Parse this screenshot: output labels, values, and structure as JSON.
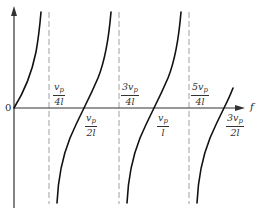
{
  "diagram": {
    "type": "tangent-like periodic function plot (reactance vs frequency)",
    "origin_label": "0",
    "x_axis_label": "f",
    "colors": {
      "curve": "#111111",
      "axis": "#333333",
      "asymptote": "#999999",
      "text": "#333333"
    },
    "asymptotes": [
      {
        "num": "v",
        "sub": "p",
        "coef": "",
        "den": "4l",
        "text": "v_p/4l"
      },
      {
        "num": "v",
        "sub": "p",
        "coef": "3",
        "den": "4l",
        "text": "3v_p/4l"
      },
      {
        "num": "v",
        "sub": "p",
        "coef": "5",
        "den": "4l",
        "text": "5v_p/4l"
      }
    ],
    "zero_crossings": [
      {
        "num": "v",
        "sub": "p",
        "coef": "",
        "den": "2l",
        "text": "v_p/2l"
      },
      {
        "num": "v",
        "sub": "p",
        "coef": "",
        "den": "l",
        "text": "v_p/l"
      },
      {
        "num": "v",
        "sub": "p",
        "coef": "3",
        "den": "2l",
        "text": "3v_p/2l"
      }
    ]
  }
}
